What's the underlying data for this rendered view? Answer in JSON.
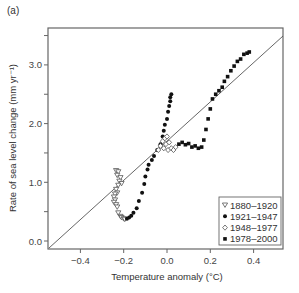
{
  "panel_label": "(a)",
  "chart_data": {
    "type": "scatter",
    "title": "",
    "xlabel": "Temperature anomaly (°C)",
    "ylabel": "Rate of sea level change (mm yr⁻¹)",
    "xlim": [
      -0.54,
      0.54
    ],
    "ylim": [
      -0.13,
      3.6
    ],
    "xticks": [
      -0.4,
      -0.2,
      0.0,
      0.2,
      0.4
    ],
    "xtick_labels": [
      "−0.4",
      "−0.2",
      "0.0",
      "0.2",
      "0.4"
    ],
    "yticks": [
      0.0,
      0.5,
      1.0,
      1.5,
      2.0,
      2.5,
      3.0,
      3.5
    ],
    "ytick_labels": [
      "0.0",
      "",
      "1.0",
      "",
      "2.0",
      "",
      "3.0",
      ""
    ],
    "grid": false,
    "legend_position": "lower right",
    "reference_line": {
      "x": [
        -0.53,
        0.53
      ],
      "y": [
        -0.05,
        3.5
      ]
    },
    "series": [
      {
        "name": "1880–1920",
        "marker": "open-triangle-down",
        "points": [
          [
            -0.235,
            1.2
          ],
          [
            -0.225,
            1.18
          ],
          [
            -0.23,
            1.12
          ],
          [
            -0.215,
            1.08
          ],
          [
            -0.22,
            1.02
          ],
          [
            -0.21,
            0.98
          ],
          [
            -0.225,
            0.95
          ],
          [
            -0.235,
            0.88
          ],
          [
            -0.23,
            0.82
          ],
          [
            -0.24,
            0.8
          ],
          [
            -0.245,
            0.75
          ],
          [
            -0.24,
            0.7
          ],
          [
            -0.245,
            0.66
          ],
          [
            -0.235,
            0.62
          ],
          [
            -0.23,
            0.58
          ],
          [
            -0.225,
            0.48
          ],
          [
            -0.215,
            0.42
          ],
          [
            -0.21,
            0.4
          ],
          [
            -0.2,
            0.38
          ],
          [
            -0.195,
            0.37
          ]
        ]
      },
      {
        "name": "1921–1947",
        "marker": "filled-circle",
        "points": [
          [
            -0.185,
            0.38
          ],
          [
            -0.175,
            0.4
          ],
          [
            -0.165,
            0.43
          ],
          [
            -0.155,
            0.48
          ],
          [
            -0.14,
            0.56
          ],
          [
            -0.13,
            0.68
          ],
          [
            -0.115,
            0.82
          ],
          [
            -0.105,
            0.97
          ],
          [
            -0.1,
            1.1
          ],
          [
            -0.09,
            1.22
          ],
          [
            -0.085,
            1.3
          ],
          [
            -0.07,
            1.38
          ],
          [
            -0.06,
            1.45
          ],
          [
            -0.045,
            1.55
          ],
          [
            -0.03,
            1.65
          ],
          [
            -0.02,
            1.78
          ],
          [
            -0.015,
            1.88
          ],
          [
            -0.01,
            1.98
          ],
          [
            0.0,
            2.08
          ],
          [
            0.005,
            2.2
          ],
          [
            0.01,
            2.3
          ],
          [
            0.015,
            2.38
          ],
          [
            0.015,
            2.45
          ],
          [
            0.02,
            2.5
          ]
        ]
      },
      {
        "name": "1948–1977",
        "marker": "open-diamond",
        "points": [
          [
            -0.04,
            1.55
          ],
          [
            -0.03,
            1.62
          ],
          [
            -0.02,
            1.7
          ],
          [
            -0.01,
            1.75
          ],
          [
            0.0,
            1.78
          ],
          [
            -0.015,
            1.58
          ],
          [
            0.005,
            1.55
          ],
          [
            0.02,
            1.58
          ],
          [
            0.03,
            1.55
          ],
          [
            0.04,
            1.6
          ],
          [
            -0.005,
            1.65
          ],
          [
            0.01,
            1.68
          ]
        ]
      },
      {
        "name": "1978–2000",
        "marker": "filled-square",
        "points": [
          [
            0.055,
            1.65
          ],
          [
            0.07,
            1.68
          ],
          [
            0.085,
            1.64
          ],
          [
            0.1,
            1.66
          ],
          [
            0.115,
            1.6
          ],
          [
            0.13,
            1.62
          ],
          [
            0.145,
            1.58
          ],
          [
            0.16,
            1.6
          ],
          [
            0.17,
            1.72
          ],
          [
            0.18,
            1.9
          ],
          [
            0.19,
            2.08
          ],
          [
            0.2,
            2.25
          ],
          [
            0.21,
            2.42
          ],
          [
            0.225,
            2.5
          ],
          [
            0.24,
            2.56
          ],
          [
            0.255,
            2.62
          ],
          [
            0.265,
            2.72
          ],
          [
            0.28,
            2.8
          ],
          [
            0.295,
            2.9
          ],
          [
            0.31,
            2.98
          ],
          [
            0.325,
            3.06
          ],
          [
            0.34,
            3.1
          ],
          [
            0.355,
            3.18
          ],
          [
            0.37,
            3.2
          ],
          [
            0.38,
            3.22
          ]
        ]
      }
    ]
  }
}
